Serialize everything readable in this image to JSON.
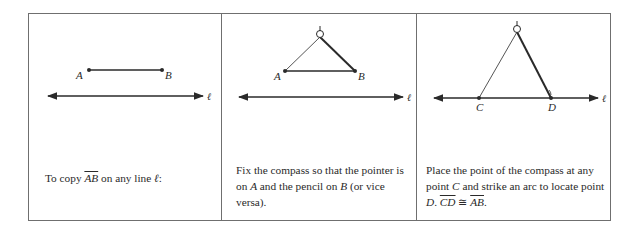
{
  "panels": [
    {
      "id": "step-1",
      "points": [
        {
          "label": "A",
          "x": 89,
          "y": 70
        },
        {
          "label": "B",
          "x": 162,
          "y": 70
        }
      ],
      "line_label": "ℓ",
      "caption": {
        "prefix": "To copy ",
        "segment": "AB",
        "suffix": " on any line ",
        "line_symbol": "ℓ",
        "end": ":"
      }
    },
    {
      "id": "step-2",
      "points": [
        {
          "label": "A",
          "x": 285,
          "y": 71
        },
        {
          "label": "B",
          "x": 355,
          "y": 71
        }
      ],
      "compass_apex": {
        "x": 320,
        "y": 36
      },
      "line_label": "ℓ",
      "caption": {
        "line1": "Fix the compass so that the pointer is",
        "line2_a": "on ",
        "line2_A": "A",
        "line2_b": " and the pencil on ",
        "line2_B": "B",
        "line2_c": " (or vice",
        "line3": "versa)."
      }
    },
    {
      "id": "step-3",
      "points": [
        {
          "label": "C",
          "x": 479,
          "y": 98
        },
        {
          "label": "D",
          "x": 551,
          "y": 98
        }
      ],
      "compass_apex": {
        "x": 517,
        "y": 31
      },
      "line_label": "ℓ",
      "caption": {
        "line1": "Place the point of the compass at any",
        "line2_a": "point ",
        "line2_C": "C",
        "line2_b": " and strike an arc to locate point",
        "line3_D": "D",
        "line3_dot": ". ",
        "line3_seg1": "CD",
        "line3_cong": " ≅ ",
        "line3_seg2": "AB",
        "line3_end": "."
      }
    }
  ]
}
